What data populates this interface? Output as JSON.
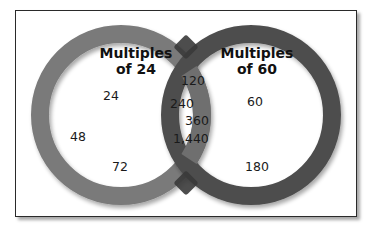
{
  "diagram": {
    "type": "venn",
    "sets": [
      {
        "name": "left",
        "title_line1": "Multiples",
        "title_line2": "of 24",
        "only_values": [
          "24",
          "48",
          "72"
        ],
        "ring_color": "#7a7a7a"
      },
      {
        "name": "right",
        "title_line1": "Multiples",
        "title_line2": "of 60",
        "only_values": [
          "60",
          "180"
        ],
        "ring_color": "#4e4e4e"
      }
    ],
    "intersection_values": [
      "120",
      "240",
      "360",
      "1,440"
    ]
  }
}
